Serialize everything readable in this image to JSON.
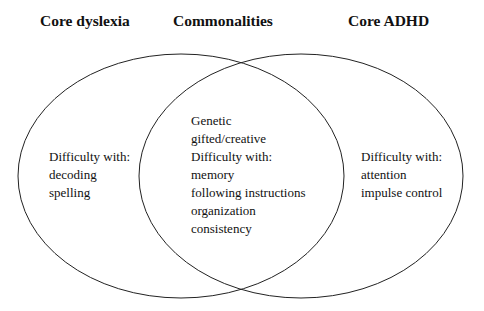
{
  "titles": {
    "left": "Core dyslexia",
    "center": "Commonalities",
    "right": "Core ADHD"
  },
  "left_region": {
    "lines": [
      "Difficulty with:",
      "decoding",
      "spelling"
    ]
  },
  "center_region": {
    "lines": [
      "Genetic",
      "gifted/creative",
      "Difficulty with:",
      "memory",
      "following instructions",
      "organization",
      "consistency"
    ]
  },
  "right_region": {
    "lines": [
      "Difficulty with:",
      "attention",
      "impulse control"
    ]
  },
  "colors": {
    "stroke": "#222222",
    "background": "#ffffff",
    "text": "#111111"
  }
}
